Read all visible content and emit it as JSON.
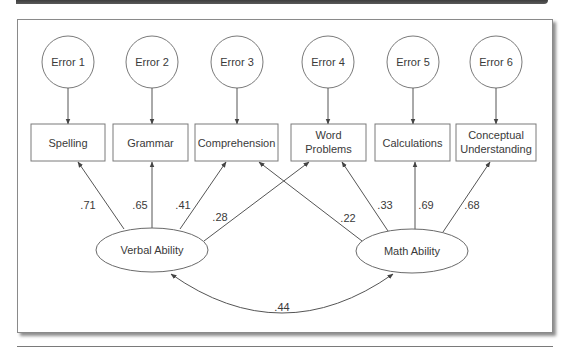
{
  "diagram": {
    "type": "structural equation model path diagram",
    "errors": [
      {
        "id": "e1",
        "label": "Error 1",
        "cx": 68,
        "cy": 62
      },
      {
        "id": "e2",
        "label": "Error 2",
        "cx": 152,
        "cy": 62
      },
      {
        "id": "e3",
        "label": "Error 3",
        "cx": 237,
        "cy": 62
      },
      {
        "id": "e4",
        "label": "Error 4",
        "cx": 328,
        "cy": 62
      },
      {
        "id": "e5",
        "label": "Error 5",
        "cx": 413,
        "cy": 62
      },
      {
        "id": "e6",
        "label": "Error 6",
        "cx": 496,
        "cy": 62
      }
    ],
    "indicators": [
      {
        "id": "spelling",
        "lines": [
          "Spelling"
        ],
        "x": 31,
        "w": 74
      },
      {
        "id": "grammar",
        "lines": [
          "Grammar"
        ],
        "x": 113,
        "w": 75
      },
      {
        "id": "comprehension",
        "lines": [
          "Comprehension"
        ],
        "x": 195,
        "w": 83
      },
      {
        "id": "word-problems",
        "lines": [
          "Word",
          "Problems"
        ],
        "x": 291,
        "w": 75
      },
      {
        "id": "calculations",
        "lines": [
          "Calculations"
        ],
        "x": 375,
        "w": 75
      },
      {
        "id": "conceptual-understanding",
        "lines": [
          "Conceptual",
          "Understanding"
        ],
        "x": 456,
        "w": 80
      }
    ],
    "factors": [
      {
        "id": "verbal",
        "label": "Verbal Ability",
        "cx": 152,
        "cy": 250
      },
      {
        "id": "math",
        "label": "Math Ability",
        "cx": 412,
        "cy": 251
      }
    ],
    "loadings": [
      {
        "from": "Verbal Ability",
        "to": "Spelling",
        "value": ".71",
        "x1": 124,
        "y1": 229,
        "x2": 78,
        "y2": 162,
        "lx": 88,
        "ly": 209
      },
      {
        "from": "Verbal Ability",
        "to": "Grammar",
        "value": ".65",
        "x1": 152,
        "y1": 228,
        "x2": 152,
        "y2": 162,
        "lx": 140,
        "ly": 209
      },
      {
        "from": "Verbal Ability",
        "to": "Comprehension",
        "value": ".41",
        "x1": 180,
        "y1": 229,
        "x2": 226,
        "y2": 162,
        "lx": 183,
        "ly": 209
      },
      {
        "from": "Verbal Ability",
        "to": "Word Problems",
        "value": ".28",
        "x1": 204,
        "y1": 241,
        "x2": 309,
        "y2": 162,
        "lx": 220,
        "ly": 221
      },
      {
        "from": "Math Ability",
        "to": "Comprehension",
        "value": ".22",
        "x1": 362,
        "y1": 241,
        "x2": 259,
        "y2": 162,
        "lx": 348,
        "ly": 222
      },
      {
        "from": "Math Ability",
        "to": "Word Problems",
        "value": ".33",
        "x1": 388,
        "y1": 231,
        "x2": 342,
        "y2": 162,
        "lx": 385,
        "ly": 209
      },
      {
        "from": "Math Ability",
        "to": "Calculations",
        "value": ".69",
        "x1": 415,
        "y1": 230,
        "x2": 415,
        "y2": 162,
        "lx": 426,
        "ly": 209
      },
      {
        "from": "Math Ability",
        "to": "Conceptual Understanding",
        "value": ".68",
        "x1": 443,
        "y1": 232,
        "x2": 490,
        "y2": 162,
        "lx": 472,
        "ly": 209
      }
    ],
    "correlation": {
      "between": [
        "Verbal Ability",
        "Math Ability"
      ],
      "value": ".44",
      "lx": 282,
      "ly": 311
    }
  }
}
